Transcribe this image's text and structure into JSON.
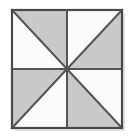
{
  "image": {
    "title": "Pinwheel shaded square",
    "width": 134,
    "height": 138,
    "background_color": "#ffffff"
  },
  "figure": {
    "name": "pinwheel-square",
    "square": {
      "left": 12,
      "top": 10,
      "right": 122,
      "bottom": 128,
      "width": 110,
      "height": 118,
      "center_x": 67,
      "center_y": 69
    },
    "colors": {
      "shaded_fill": "#c9c9c9",
      "unshaded_fill": "#fbfbfb",
      "outline": "#4a4a4a",
      "inner_line": "#555555",
      "diagonal_line": "#555555",
      "shadow": "#e3e3e3"
    },
    "stroke_widths": {
      "outline": 2.2,
      "inner_line": 2.0,
      "diagonal_line": 2.0
    },
    "quadrants": [
      {
        "name": "top-left",
        "diagonal": "top-left to bottom-right",
        "shaded_half": "upper-right",
        "unshaded_half": "lower-left"
      },
      {
        "name": "top-right",
        "diagonal": "bottom-left to top-right",
        "shaded_half": "lower-right",
        "unshaded_half": "upper-left"
      },
      {
        "name": "bottom-left",
        "diagonal": "bottom-left to top-right",
        "shaded_half": "upper-left",
        "unshaded_half": "lower-right"
      },
      {
        "name": "bottom-right",
        "diagonal": "top-left to bottom-right",
        "shaded_half": "lower-left",
        "unshaded_half": "upper-right"
      }
    ],
    "triangles": [
      {
        "id": "t1",
        "quadrant": "top-left",
        "shaded": true,
        "points": "12,10 67,10 67,69"
      },
      {
        "id": "t2",
        "quadrant": "top-left",
        "shaded": false,
        "points": "12,10 67,69 12,69"
      },
      {
        "id": "t3",
        "quadrant": "top-right",
        "shaded": false,
        "points": "67,10 122,10 67,69"
      },
      {
        "id": "t4",
        "quadrant": "top-right",
        "shaded": true,
        "points": "122,10 122,69 67,69"
      },
      {
        "id": "t5",
        "quadrant": "bottom-left",
        "shaded": true,
        "points": "12,69 67,69 12,128"
      },
      {
        "id": "t6",
        "quadrant": "bottom-left",
        "shaded": false,
        "points": "67,69 67,128 12,128"
      },
      {
        "id": "t7",
        "quadrant": "bottom-right",
        "shaded": true,
        "points": "67,69 122,128 67,128"
      },
      {
        "id": "t8",
        "quadrant": "bottom-right",
        "shaded": false,
        "points": "67,69 122,69 122,128"
      }
    ],
    "lines": [
      {
        "id": "vertical-midline",
        "x1": 67,
        "y1": 10,
        "x2": 67,
        "y2": 128
      },
      {
        "id": "horizontal-midline",
        "x1": 12,
        "y1": 69,
        "x2": 122,
        "y2": 69
      },
      {
        "id": "diagonal-nw-se",
        "x1": 12,
        "y1": 10,
        "x2": 122,
        "y2": 128
      },
      {
        "id": "diagonal-sw-ne",
        "x1": 12,
        "y1": 128,
        "x2": 122,
        "y2": 10
      }
    ]
  }
}
